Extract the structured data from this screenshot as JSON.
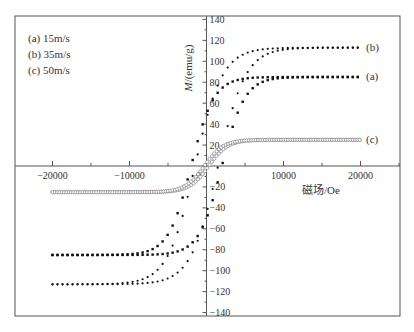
{
  "chart_data": {
    "type": "scatter",
    "title": "",
    "xlabel": "磁场/Oe",
    "ylabel": "M/(emu/g)",
    "xlim": [
      -25000,
      25000
    ],
    "ylim": [
      -140,
      140
    ],
    "x_ticks": [
      -20000,
      -10000,
      0,
      10000,
      20000
    ],
    "x_tick_labels": [
      "-20000",
      "-10000",
      "0",
      "10000",
      "20000"
    ],
    "y_ticks": [
      -140,
      -120,
      -100,
      -80,
      -60,
      -40,
      -20,
      0,
      20,
      40,
      60,
      80,
      100,
      120,
      140
    ],
    "y_tick_labels": [
      "-140",
      "-120",
      "-100",
      "-80",
      "-60",
      "-40",
      "-20",
      "0",
      "20",
      "40",
      "60",
      "80",
      "100",
      "120",
      "140"
    ],
    "grid": false,
    "legend": {
      "position": "upper-left",
      "entries": [
        "(a) 15m/s",
        "(b) 35m/s",
        "(c) 50m/s"
      ]
    },
    "series": [
      {
        "name": "(a) 15m/s",
        "label": "(a)",
        "marker": "filled-square",
        "Ms": 85,
        "Mr": 50,
        "Hc": 2000,
        "x": [
          -20000,
          -15000,
          -10000,
          -5000,
          -2000,
          0,
          2000,
          5000,
          10000,
          15000,
          20000
        ],
        "upper": [
          -85,
          -80,
          -73,
          -63,
          -55,
          50,
          60,
          66,
          74,
          80,
          85
        ],
        "lower": [
          -85,
          -80,
          -74,
          -66,
          -60,
          -50,
          55,
          63,
          73,
          80,
          85
        ]
      },
      {
        "name": "(b) 35m/s",
        "label": "(b)",
        "marker": "filled-dot",
        "Ms": 113,
        "Mr": 45,
        "Hc": 1500,
        "x": [
          -20000,
          -15000,
          -10000,
          -5000,
          -2000,
          0,
          2000,
          5000,
          10000,
          15000,
          20000
        ],
        "upper": [
          -113,
          -110,
          -104,
          -90,
          -60,
          45,
          90,
          100,
          106,
          110,
          113
        ],
        "lower": [
          -113,
          -110,
          -106,
          -100,
          -90,
          -45,
          60,
          90,
          104,
          110,
          113
        ]
      },
      {
        "name": "(c) 50m/s",
        "label": "(c)",
        "marker": "open-circle",
        "Ms": 25,
        "Mr": 3,
        "Hc": 300,
        "x": [
          -20000,
          -15000,
          -10000,
          -5000,
          0,
          5000,
          10000,
          15000,
          20000
        ],
        "upper": [
          -23,
          -21,
          -18,
          -12,
          3,
          13,
          19,
          23,
          25
        ],
        "lower": [
          -25,
          -23,
          -19,
          -13,
          -3,
          12,
          18,
          21,
          23
        ]
      }
    ],
    "curve_end_labels": [
      "(b)",
      "(a)",
      "(c)"
    ]
  }
}
